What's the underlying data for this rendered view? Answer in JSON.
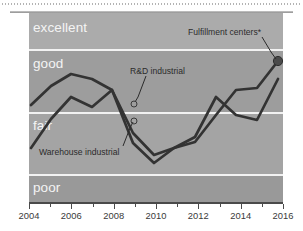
{
  "chart_data": {
    "type": "line",
    "title": "",
    "subtitle": "",
    "xlabel": "",
    "ylabel": "",
    "x": [
      2004,
      2005,
      2006,
      2007,
      2008,
      2009,
      2010,
      2011,
      2012,
      2013,
      2014,
      2015,
      2016
    ],
    "xlim": [
      2004,
      2016
    ],
    "xticks_major": [
      2004,
      2006,
      2008,
      2010,
      2012,
      2014,
      2016
    ],
    "xtick_labels": [
      "2004",
      "2006",
      "2008",
      "2010",
      "2012",
      "2014",
      "2016"
    ],
    "xticks_minor": [
      2005,
      2007,
      2009,
      2011,
      2013,
      2015
    ],
    "grid": false,
    "legend_position": "inline-annotations",
    "y_category_bands": [
      {
        "label": "excellent",
        "from": 4.0,
        "to": 5.0
      },
      {
        "label": "good",
        "from": 3.0,
        "to": 4.0
      },
      {
        "label": "fair",
        "from": 2.0,
        "to": 3.0
      },
      {
        "label": "poor",
        "from": 1.0,
        "to": 2.0
      }
    ],
    "ylim": [
      1.0,
      5.0
    ],
    "series": [
      {
        "name": "R&D industrial",
        "values": [
          2.85,
          3.25,
          3.5,
          3.4,
          3.62,
          3.05,
          2.63,
          2.78,
          2.9,
          3.35,
          3.78,
          3.82,
          3.88
        ]
      },
      {
        "name": "Fulfillment centers*",
        "values": [
          2.85,
          3.25,
          3.5,
          3.4,
          3.62,
          3.05,
          2.63,
          2.78,
          2.9,
          3.35,
          3.78,
          3.82,
          3.88
        ],
        "endpoint_marker": true,
        "endpoint_value": 3.88
      },
      {
        "name": "Warehouse industrial",
        "values": [
          1.95,
          2.58,
          3.02,
          2.86,
          3.62,
          2.5,
          2.2,
          2.52,
          2.72,
          3.28,
          3.05,
          2.96,
          3.45
        ]
      }
    ],
    "annotations": [
      {
        "text": "Fulfillment centers*",
        "target_x": 2016,
        "target_y": 3.88
      },
      {
        "text": "R&D industrial",
        "target_x": 2009,
        "target_y": 3.05
      },
      {
        "text": "Warehouse industrial",
        "target_x": 2009,
        "target_y": 2.5
      }
    ],
    "colors": {
      "plot_background": "#9f9f9f",
      "band_excellent": "#aaaaaa",
      "band_good": "#9d9d9d",
      "band_fair": "#a3a3a3",
      "band_poor": "#9a9a9a",
      "band_separator": "#f2f2f2",
      "series_line": "#333333",
      "band_label_text": "#f4f4f4",
      "annotation_text": "#2b2b2b",
      "axis": "#4a4a4a"
    }
  },
  "bands": {
    "excellent": "excellent",
    "good": "good",
    "fair": "fair",
    "poor": "poor"
  },
  "annotations": {
    "fulfillment": "Fulfillment centers*",
    "rd": "R&D industrial",
    "warehouse": "Warehouse industrial"
  },
  "axis": {
    "labels": [
      "2004",
      "2006",
      "2008",
      "2010",
      "2012",
      "2014",
      "2016"
    ]
  }
}
